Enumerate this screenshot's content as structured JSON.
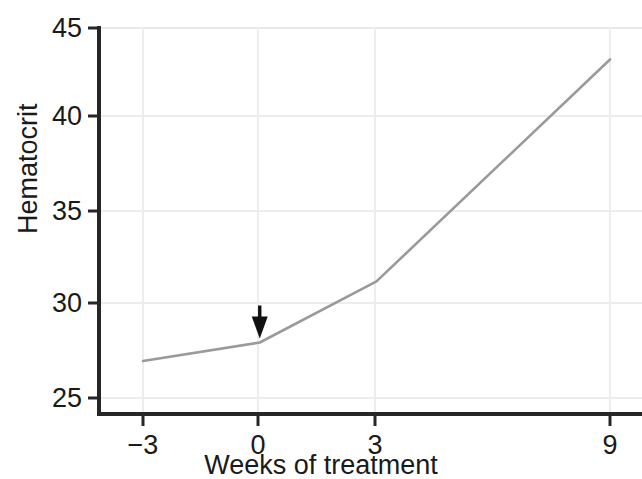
{
  "chart_data": {
    "type": "line",
    "title": "",
    "xlabel": "Weeks of treatment",
    "ylabel": "Hematocrit",
    "x": [
      -3,
      0,
      3,
      9
    ],
    "values": [
      27.0,
      28.0,
      31.3,
      43.3
    ],
    "series": [
      {
        "name": "Hematocrit",
        "x": [
          -3,
          0,
          3,
          9
        ],
        "values": [
          27.0,
          28.0,
          31.3,
          43.3
        ]
      }
    ],
    "xtick_labels": [
      "−3",
      "0",
      "3",
      "9"
    ],
    "xticks": [
      -3,
      0,
      3,
      9
    ],
    "ytick_labels": [
      "25",
      "30",
      "35",
      "40",
      "45"
    ],
    "yticks": [
      25,
      30,
      35,
      40,
      45
    ],
    "xlim": [
      -4.2,
      9.8
    ],
    "ylim": [
      24.3,
      45
    ],
    "grid": true,
    "legend": "none",
    "annotations": [
      {
        "type": "arrow",
        "label": "",
        "x": 0,
        "y": 28.0,
        "direction": "down",
        "description": "downward arrow marking start of treatment at week 0"
      }
    ],
    "colors": {
      "line": "#9a9a9a",
      "axis": "#262626",
      "grid": "#ebebeb",
      "text": "#1a1a1a",
      "arrow": "#111111",
      "background": "#ffffff"
    }
  },
  "axes": {
    "y_title": "Hematocrit",
    "x_title": "Weeks of treatment",
    "y_ticks": [
      {
        "label": "45"
      },
      {
        "label": "40"
      },
      {
        "label": "35"
      },
      {
        "label": "30"
      },
      {
        "label": "25"
      }
    ],
    "x_ticks": [
      {
        "label": "−3"
      },
      {
        "label": "0"
      },
      {
        "label": "3"
      },
      {
        "label": "9"
      }
    ]
  }
}
